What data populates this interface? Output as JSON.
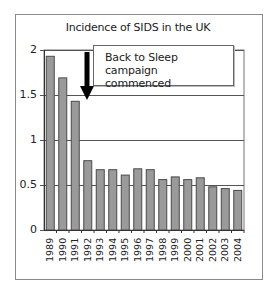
{
  "chart_data": {
    "type": "bar",
    "title": "Incidence of SIDS in the UK",
    "xlabel": "",
    "ylabel": "",
    "categories": [
      "1989",
      "1990",
      "1991",
      "1992",
      "1993",
      "1994",
      "1995",
      "1996",
      "1997",
      "1998",
      "1999",
      "2000",
      "2001",
      "2002",
      "2003",
      "2004"
    ],
    "values": [
      1.93,
      1.69,
      1.43,
      0.77,
      0.67,
      0.67,
      0.61,
      0.68,
      0.67,
      0.56,
      0.59,
      0.56,
      0.58,
      0.48,
      0.46,
      0.44
    ],
    "ylim": [
      0,
      2
    ],
    "yticks": [
      "0",
      "0.5",
      "1",
      "1.5",
      "2"
    ],
    "grid": true,
    "legend": null,
    "annotations": [
      {
        "text": "Back to Sleep campaign commenced",
        "arrow_at": "between 1991 and 1992",
        "line1": "Back to Sleep campaign",
        "line2": "commenced"
      }
    ],
    "colors": {
      "bar_fill": "#9a9a9a",
      "bar_edge": "#4a4a4a",
      "grid": "#555555",
      "frame": "#8a8a8a"
    }
  }
}
